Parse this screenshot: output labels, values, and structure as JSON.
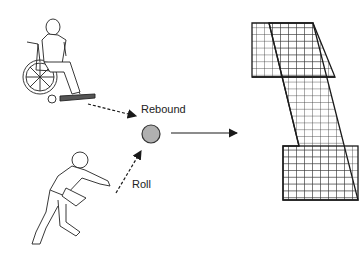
{
  "diagram": {
    "labels": {
      "rebound": "Rebound",
      "roll": "Roll"
    },
    "elements": [
      {
        "id": "wheelchair-user",
        "type": "illustration"
      },
      {
        "id": "rolling-player",
        "type": "illustration"
      },
      {
        "id": "ball",
        "type": "circle",
        "fill": "#b0b0b0"
      },
      {
        "id": "rebound-net",
        "type": "grid-frame"
      }
    ],
    "arrows": [
      {
        "from": "wheelchair-user",
        "to": "ball",
        "style": "dashed"
      },
      {
        "from": "rolling-player",
        "to": "ball",
        "style": "dashed",
        "label": "Roll"
      },
      {
        "from": "ball",
        "to": "rebound-net",
        "style": "solid"
      }
    ],
    "colors": {
      "line": "#1a1a1a",
      "ball": "#b0b0b0"
    }
  }
}
